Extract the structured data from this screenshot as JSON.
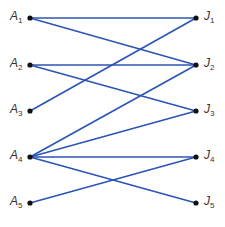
{
  "diagram": {
    "type": "bipartite-graph",
    "edge_color": "#2b55b5",
    "node_color": "#111111",
    "left_nodes": [
      {
        "id": "A1",
        "label": "A",
        "sub": "1",
        "y": 18
      },
      {
        "id": "A2",
        "label": "A",
        "sub": "2",
        "y": 65
      },
      {
        "id": "A3",
        "label": "A",
        "sub": "3",
        "y": 111
      },
      {
        "id": "A4",
        "label": "A",
        "sub": "4",
        "y": 157
      },
      {
        "id": "A5",
        "label": "A",
        "sub": "5",
        "y": 203
      }
    ],
    "right_nodes": [
      {
        "id": "J1",
        "label": "J",
        "sub": "1",
        "y": 18
      },
      {
        "id": "J2",
        "label": "J",
        "sub": "2",
        "y": 65
      },
      {
        "id": "J3",
        "label": "J",
        "sub": "3",
        "y": 111
      },
      {
        "id": "J4",
        "label": "J",
        "sub": "4",
        "y": 157
      },
      {
        "id": "J5",
        "label": "J",
        "sub": "5",
        "y": 203
      }
    ],
    "edges": [
      [
        "A1",
        "J1"
      ],
      [
        "A1",
        "J2"
      ],
      [
        "A2",
        "J2"
      ],
      [
        "A2",
        "J3"
      ],
      [
        "A3",
        "J1"
      ],
      [
        "A4",
        "J2"
      ],
      [
        "A4",
        "J3"
      ],
      [
        "A4",
        "J4"
      ],
      [
        "A4",
        "J5"
      ],
      [
        "A5",
        "J4"
      ]
    ]
  }
}
